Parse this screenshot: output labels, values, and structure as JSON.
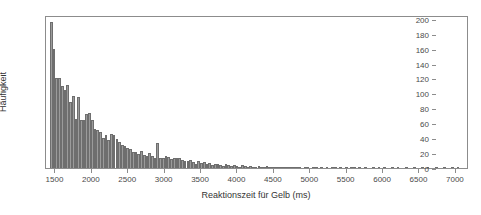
{
  "chart_data": {
    "type": "bar",
    "title": "",
    "subtitle": "",
    "xlabel": "Reaktionszeit für Gelb (ms)",
    "ylabel": "Häufigkeit",
    "xlim": [
      1370,
      7180
    ],
    "ylim": [
      0,
      205
    ],
    "grid": false,
    "legend": null,
    "bin_width": 37.5,
    "bar_color": "#9b9b9b",
    "bar_edge_color": "#6e6e6e",
    "frame_color": "#8c8c8c",
    "xticks": [
      1500,
      2000,
      2500,
      3000,
      3500,
      4000,
      4500,
      5000,
      5500,
      6000,
      6500,
      7000
    ],
    "xtick_labels": [
      "1500",
      "2000",
      "2500",
      "3000",
      "3500",
      "4000",
      "4500",
      "5000",
      "5500",
      "6000",
      "6500",
      "7000"
    ],
    "yticks": [
      0,
      20,
      40,
      60,
      80,
      100,
      120,
      140,
      160,
      180,
      200
    ],
    "ytick_labels": [
      "0",
      "20",
      "40",
      "60",
      "80",
      "100",
      "120",
      "140",
      "160",
      "180",
      "200"
    ],
    "bin_starts": [
      1425,
      1462,
      1500,
      1537,
      1575,
      1612,
      1650,
      1687,
      1725,
      1762,
      1800,
      1837,
      1875,
      1912,
      1950,
      1987,
      2025,
      2062,
      2100,
      2137,
      2175,
      2212,
      2250,
      2287,
      2325,
      2362,
      2400,
      2437,
      2475,
      2512,
      2550,
      2587,
      2625,
      2662,
      2700,
      2737,
      2775,
      2812,
      2850,
      2887,
      2925,
      2962,
      3000,
      3037,
      3075,
      3112,
      3150,
      3187,
      3225,
      3262,
      3300,
      3337,
      3375,
      3412,
      3450,
      3487,
      3525,
      3562,
      3600,
      3637,
      3675,
      3712,
      3750,
      3787,
      3825,
      3862,
      3900,
      3937,
      3975,
      4012,
      4050,
      4087,
      4125,
      4162,
      4200,
      4237,
      4275,
      4312,
      4350,
      4387,
      4425,
      4462,
      4500,
      4537,
      4575,
      4612,
      4650,
      4687,
      4725,
      4762,
      4800,
      4837,
      4875,
      4912,
      4950,
      4987,
      5025,
      5062,
      5100,
      5137,
      5175,
      5212,
      5250,
      5287,
      5325,
      5362,
      5400,
      5437,
      5475,
      5512,
      5550,
      5587,
      5625,
      5662,
      5700,
      5737,
      5775,
      5812,
      5850,
      5887,
      5925,
      5962,
      6000,
      6037,
      6075,
      6112,
      6150,
      6187,
      6225,
      6262,
      6300,
      6337,
      6375,
      6412,
      6450,
      6487,
      6525,
      6562,
      6600,
      6637,
      6675,
      6712,
      6750,
      6787,
      6825,
      6862,
      6900,
      6937,
      6975,
      7012,
      7050,
      7087
    ],
    "values": [
      195,
      159,
      121,
      121,
      110,
      104,
      111,
      88,
      96,
      66,
      95,
      65,
      65,
      73,
      74,
      65,
      52,
      51,
      48,
      40,
      44,
      37,
      46,
      44,
      39,
      35,
      31,
      29,
      27,
      25,
      22,
      21,
      19,
      23,
      18,
      16,
      20,
      16,
      14,
      33,
      14,
      14,
      16,
      15,
      12,
      13,
      14,
      13,
      11,
      9,
      10,
      11,
      8,
      5,
      9,
      7,
      8,
      6,
      7,
      4,
      5,
      6,
      4,
      3,
      5,
      4,
      3,
      4,
      3,
      2,
      4,
      3,
      2,
      3,
      2,
      2,
      3,
      2,
      2,
      3,
      2,
      1,
      2,
      1,
      1,
      2,
      1,
      1,
      1,
      1,
      2,
      1,
      0,
      1,
      1,
      0,
      1,
      1,
      0,
      1,
      0,
      1,
      0,
      1,
      1,
      0,
      1,
      0,
      1,
      0,
      1,
      1,
      0,
      1,
      0,
      1,
      0,
      0,
      1,
      0,
      1,
      0,
      1,
      0,
      0,
      1,
      0,
      1,
      0,
      0,
      1,
      0,
      0,
      1,
      0,
      0,
      1,
      0,
      1,
      0,
      0,
      1,
      0,
      0,
      1,
      0,
      0,
      1,
      0,
      1
    ]
  },
  "figure": {
    "background_color": "#ffffff",
    "axis_text_color": "#4a4a4a",
    "title_text_color": "#333333"
  }
}
